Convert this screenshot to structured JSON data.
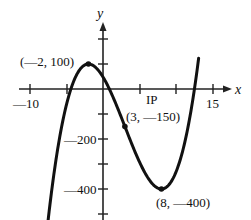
{
  "chart_data": {
    "type": "line",
    "title": "",
    "xlabel": "x",
    "ylabel": "y",
    "x_ticks": [
      -10,
      -5,
      5,
      10,
      15
    ],
    "x_tick_labels": [
      "—10",
      "15"
    ],
    "y_ticks": [
      200,
      100,
      -100,
      -200,
      -300,
      -400,
      -500
    ],
    "y_tick_labels": [
      "—200",
      "—400"
    ],
    "xlim": [
      -12,
      17
    ],
    "ylim": [
      -520,
      350
    ],
    "function": "y = (x-3)^3 - 75(x-3) - 150",
    "series": [
      {
        "name": "cubic",
        "x": [
          -7.9,
          -6,
          -4,
          -2,
          0,
          3,
          6,
          8,
          10,
          12,
          13.1
        ],
        "values": [
          -471.5,
          -204,
          17,
          100,
          48,
          -150,
          -348,
          -400,
          -332,
          -105,
          110
        ]
      }
    ],
    "annotations": [
      {
        "label": "(—2, 100)",
        "x": -2,
        "y": 100,
        "kind": "local maximum"
      },
      {
        "label": "(3, —150)",
        "x": 3,
        "y": -150,
        "kind": "inflection point"
      },
      {
        "label": "(8, —400)",
        "x": 8,
        "y": -400,
        "kind": "local minimum"
      },
      {
        "label": "IP",
        "x": 7,
        "y": 0,
        "kind": "text"
      }
    ],
    "grid": false,
    "legend": null
  },
  "labels": {
    "x_axis": "x",
    "y_axis": "y",
    "x_neg10": "—10",
    "x_15": "15",
    "y_neg200": "—200",
    "y_neg400": "—400",
    "ip": "IP",
    "max_point": "(—2, 100)",
    "inflection_point": "(3, —150)",
    "min_point": "(8, —400)"
  },
  "colors": {
    "curve": "#111111",
    "axis": "#222222",
    "background": "#ffffff"
  }
}
